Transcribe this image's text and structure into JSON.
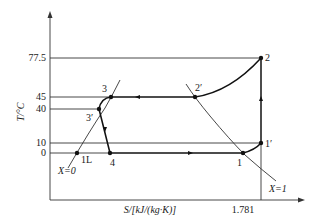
{
  "diagram": {
    "type": "T-S diagram (refrigeration cycle)",
    "y_axis": {
      "label": "T/°C",
      "ticks": [
        "77.5",
        "45",
        "40",
        "10",
        "0"
      ]
    },
    "x_axis": {
      "label": "S/[kJ/(kg·K)]",
      "ticks": [
        "1.781"
      ]
    },
    "points": {
      "p1": "1",
      "p1prime": "1′",
      "p2": "2",
      "p2prime": "2′",
      "p3": "3",
      "p3prime": "3′",
      "p4": "4",
      "p1L": "1L"
    },
    "curves": {
      "saturated_liquid": "X=0",
      "saturated_vapor": "X=1"
    }
  }
}
